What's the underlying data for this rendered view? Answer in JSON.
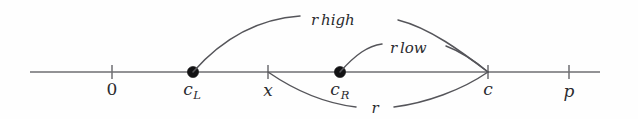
{
  "figure": {
    "type": "number-line-diagram",
    "background_color": "#fefefe",
    "line_color": "#6e6e72",
    "curve_color": "#55555a",
    "text_color": "#2b2b2f",
    "dot_color": "#121214",
    "axis": {
      "name": "real-number-line",
      "y": 72,
      "x_start": 30,
      "x_end": 600
    },
    "axis_labels": [
      {
        "id": "zero",
        "text": "0",
        "base": "0",
        "sub": "",
        "x": 112,
        "y": 95,
        "marker": "tick",
        "italic": false
      },
      {
        "id": "c-left",
        "text": "cL",
        "base": "c",
        "sub": "L",
        "x": 193,
        "y": 95,
        "marker": "dot",
        "italic": true
      },
      {
        "id": "x",
        "text": "x",
        "base": "x",
        "sub": "",
        "x": 268,
        "y": 95,
        "marker": "tick",
        "italic": true
      },
      {
        "id": "c-right",
        "text": "cR",
        "base": "c",
        "sub": "R",
        "x": 340,
        "y": 95,
        "marker": "dot",
        "italic": true
      },
      {
        "id": "c",
        "text": "c",
        "base": "c",
        "sub": "",
        "x": 488,
        "y": 95,
        "marker": "tick",
        "italic": true
      },
      {
        "id": "p",
        "text": "p",
        "base": "p",
        "sub": "",
        "x": 569,
        "y": 97,
        "marker": "tick",
        "italic": true
      }
    ],
    "curves": [
      {
        "id": "r-high",
        "label_base": "r",
        "label_sub": "high",
        "from": "cL",
        "to": "c",
        "from_x": 193,
        "from_y": 72,
        "to_x": 488,
        "to_y": 72,
        "apex_y": 18,
        "label_x": 348,
        "label_y": 22,
        "label_gap_left": 300,
        "label_gap_right": 398
      },
      {
        "id": "r-low",
        "label_base": "r",
        "label_sub": "low",
        "from": "cR",
        "to": "c",
        "from_x": 340,
        "from_y": 72,
        "to_x": 488,
        "to_y": 72,
        "apex_y": 46,
        "label_x": 412,
        "label_y": 50,
        "label_gap_left": 382,
        "label_gap_right": 446
      },
      {
        "id": "r",
        "label_base": "r",
        "label_sub": "",
        "from": "x",
        "to": "c",
        "from_x": 268,
        "from_y": 72,
        "to_x": 488,
        "to_y": 72,
        "apex_y": 112,
        "label_x": 375,
        "label_y": 110,
        "label_gap_left": 356,
        "label_gap_right": 394
      }
    ]
  }
}
